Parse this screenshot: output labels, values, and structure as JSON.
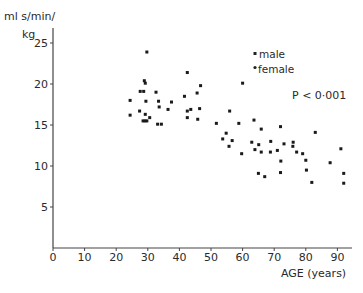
{
  "chart_data": {
    "type": "scatter",
    "title": "",
    "xlabel": "AGE (years)",
    "ylabel_line1": "ml s/min/",
    "ylabel_line2": "kg",
    "xlim": [
      0,
      95
    ],
    "ylim": [
      0,
      26
    ],
    "x_ticks": [
      0,
      10,
      20,
      30,
      40,
      50,
      60,
      70,
      80,
      90
    ],
    "y_ticks": [
      5,
      10,
      15,
      20,
      25
    ],
    "grid": false,
    "legend": [
      {
        "name": "male",
        "marker": "square"
      },
      {
        "name": "female",
        "marker": "circle"
      }
    ],
    "annotation": "P < 0·001",
    "points": [
      [
        29.7,
        23.9
      ],
      [
        42.5,
        21.4
      ],
      [
        28.9,
        20.4
      ],
      [
        29.2,
        20.1
      ],
      [
        46.7,
        19.8
      ],
      [
        27.6,
        19.1
      ],
      [
        28.7,
        19.1
      ],
      [
        32.6,
        19.0
      ],
      [
        45.6,
        18.9
      ],
      [
        41.6,
        18.5
      ],
      [
        24.4,
        18.0
      ],
      [
        29.4,
        17.9
      ],
      [
        33.4,
        17.9
      ],
      [
        37.5,
        17.8
      ],
      [
        33.6,
        17.2
      ],
      [
        36.4,
        16.9
      ],
      [
        42.5,
        16.7
      ],
      [
        43.6,
        16.9
      ],
      [
        46.4,
        17.0
      ],
      [
        27.4,
        16.7
      ],
      [
        24.4,
        16.2
      ],
      [
        29.2,
        16.3
      ],
      [
        30.6,
        15.9
      ],
      [
        42.5,
        15.9
      ],
      [
        45.8,
        15.7
      ],
      [
        28.5,
        15.5
      ],
      [
        29.1,
        15.5
      ],
      [
        29.7,
        15.5
      ],
      [
        33.1,
        15.1
      ],
      [
        34.3,
        15.1
      ],
      [
        60.0,
        20.1
      ],
      [
        55.9,
        16.7
      ],
      [
        51.7,
        15.2
      ],
      [
        58.8,
        15.2
      ],
      [
        63.6,
        15.6
      ],
      [
        72.0,
        14.8
      ],
      [
        65.9,
        14.5
      ],
      [
        83.0,
        14.1
      ],
      [
        54.8,
        14.0
      ],
      [
        53.7,
        13.3
      ],
      [
        56.7,
        13.1
      ],
      [
        62.9,
        12.9
      ],
      [
        65.1,
        12.6
      ],
      [
        68.9,
        13.0
      ],
      [
        73.1,
        12.7
      ],
      [
        76.0,
        12.9
      ],
      [
        55.7,
        12.4
      ],
      [
        75.9,
        12.4
      ],
      [
        91.1,
        12.1
      ],
      [
        63.9,
        12.0
      ],
      [
        65.9,
        11.7
      ],
      [
        68.8,
        11.7
      ],
      [
        71.0,
        11.9
      ],
      [
        77.1,
        11.7
      ],
      [
        79.0,
        11.5
      ],
      [
        59.7,
        11.5
      ],
      [
        80.0,
        10.7
      ],
      [
        72.1,
        10.6
      ],
      [
        87.7,
        10.4
      ],
      [
        80.2,
        9.5
      ],
      [
        65.0,
        9.1
      ],
      [
        72.0,
        9.2
      ],
      [
        92.0,
        9.1
      ],
      [
        67.0,
        8.7
      ],
      [
        81.9,
        8.0
      ],
      [
        92.0,
        7.9
      ]
    ]
  }
}
